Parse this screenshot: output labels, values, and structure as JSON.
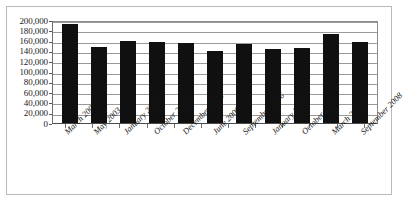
{
  "chart_data": {
    "type": "bar",
    "title": "",
    "subtitle": "",
    "xlabel": "",
    "ylabel": "",
    "categories": [
      "March 2003",
      "May 2003",
      "January 2005",
      "October 2005",
      "December 2005",
      "June 2006",
      "September 2006",
      "January 2007",
      "October 2007",
      "March 2008",
      "September 2008"
    ],
    "values": [
      193000,
      147000,
      160000,
      157000,
      155000,
      140000,
      153000,
      143000,
      145000,
      172000,
      157000
    ],
    "ylim": [
      0,
      200000
    ],
    "ytick_values": [
      0,
      20000,
      40000,
      60000,
      80000,
      100000,
      120000,
      140000,
      160000,
      180000,
      200000
    ],
    "ytick_labels": [
      "0",
      "20,000",
      "40,000",
      "60,000",
      "80,000",
      "100,000",
      "120,000",
      "140,000",
      "160,000",
      "180,000",
      "200,000"
    ],
    "grid": true,
    "legend": false,
    "legend_position": "none",
    "bar_color": "#101010",
    "gridline_color": "#9a9a9a",
    "axis_color": "#4a4a4a",
    "plot_background": "#ffffff",
    "xtick_label_rotation": -45
  }
}
